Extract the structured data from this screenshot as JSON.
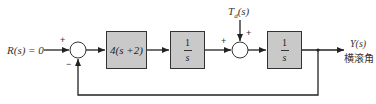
{
  "diagram": {
    "input_label": "R(s) = 0",
    "sum1": {
      "sign_top": "+",
      "sign_bottom": "−"
    },
    "block1": {
      "label": "4(s +2)"
    },
    "block2": {
      "numerator": "1",
      "denominator": "s"
    },
    "sum2": {
      "sign_left": "+",
      "sign_top": "+"
    },
    "disturbance_label": "T_d(s)",
    "disturbance": {
      "main": "T",
      "sub": "d",
      "arg": "(s)"
    },
    "block3": {
      "numerator": "1",
      "denominator": "s"
    },
    "output_label": "Y(s)",
    "output_caption": "横滚角",
    "colors": {
      "block_fill": "#c9c9c9",
      "line": "#222222",
      "background": "#ffffff"
    }
  }
}
